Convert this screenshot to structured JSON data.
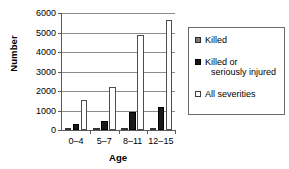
{
  "chart_data": {
    "type": "bar",
    "title": "",
    "xlabel": "Age",
    "ylabel": "Number",
    "categories": [
      "0–4",
      "5–7",
      "8–11",
      "12–15"
    ],
    "series": [
      {
        "name": "Killed",
        "values": [
          60,
          70,
          70,
          80
        ],
        "color": "#808080"
      },
      {
        "name": "Killed or seriously injured",
        "values": [
          330,
          480,
          900,
          1180
        ],
        "color": "#1a1a1a"
      },
      {
        "name": "All severities",
        "values": [
          1560,
          2230,
          4850,
          5620
        ],
        "color": "#ffffff"
      }
    ],
    "ylim": [
      0,
      6000
    ],
    "yticks": [
      0,
      1000,
      2000,
      3000,
      4000,
      5000,
      6000
    ],
    "ytick_labels": [
      "0",
      "1000",
      "2000",
      "3000",
      "4000",
      "5000",
      "6000"
    ],
    "grid": true,
    "legend_position": "right"
  },
  "legend": {
    "items": [
      {
        "label": "Killed",
        "label_cont": ""
      },
      {
        "label": "Killed or",
        "label_cont": "seriously injured"
      },
      {
        "label": "All severities",
        "label_cont": ""
      }
    ]
  }
}
